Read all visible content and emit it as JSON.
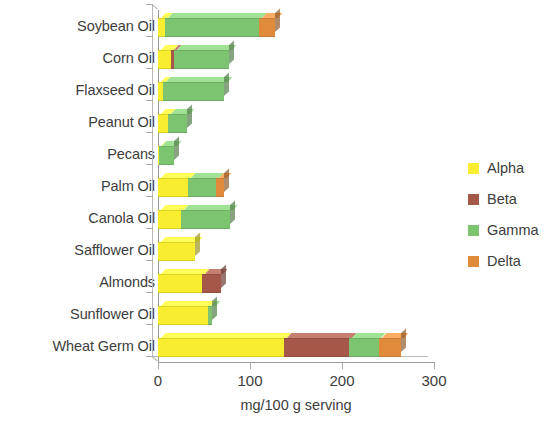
{
  "chart_data": {
    "type": "bar",
    "orientation": "horizontal",
    "stacked": true,
    "title": "",
    "xlabel": "mg/100 g serving",
    "ylabel": "",
    "xlim": [
      0,
      300
    ],
    "xticks": [
      0,
      100,
      200,
      300
    ],
    "xtick_labels": [
      "0",
      "100",
      "200",
      "300"
    ],
    "grid": false,
    "legend_position": "right",
    "categories": [
      "Soybean Oil",
      "Corn Oil",
      "Flaxseed Oil",
      "Peanut Oil",
      "Pecans",
      "Palm Oil",
      "Canola Oil",
      "Safflower Oil",
      "Almonds",
      "Sunflower Oil",
      "Wheat Germ Oil"
    ],
    "series": [
      {
        "name": "Alpha",
        "color": "#F8ED2E",
        "values": [
          8,
          14,
          5,
          11,
          1,
          33,
          25,
          40,
          48,
          54,
          137
        ]
      },
      {
        "name": "Beta",
        "color": "#A5584A",
        "values": [
          0,
          3,
          0,
          0,
          0,
          0,
          0,
          0,
          20,
          0,
          71
        ]
      },
      {
        "name": "Gamma",
        "color": "#7DC470",
        "values": [
          102,
          60,
          67,
          21,
          16,
          30,
          53,
          0,
          0,
          5,
          32
        ]
      },
      {
        "name": "Delta",
        "color": "#E08B3C",
        "values": [
          17,
          0,
          0,
          0,
          0,
          9,
          0,
          0,
          0,
          0,
          24
        ]
      }
    ],
    "totals": [
      127,
      77,
      72,
      32,
      17,
      72,
      78,
      40,
      68,
      59,
      264
    ]
  },
  "legend": {
    "entries": [
      {
        "label": "Alpha",
        "color": "#F8ED2E"
      },
      {
        "label": "Beta",
        "color": "#A5584A"
      },
      {
        "label": "Gamma",
        "color": "#7DC470"
      },
      {
        "label": "Delta",
        "color": "#E08B3C"
      }
    ]
  }
}
